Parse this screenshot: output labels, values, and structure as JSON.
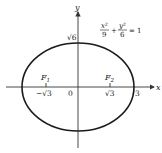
{
  "diagram": {
    "equation": {
      "x_num": "x²",
      "x_den": "9",
      "plus": "+",
      "y_num": "y²",
      "y_den": "6",
      "rhs": "= 1"
    },
    "axes": {
      "x_label": "x",
      "y_label": "y"
    },
    "labels": {
      "top_intercept": "√6",
      "origin": "0",
      "neg_focus_x": "−√3",
      "pos_focus_x": "√3",
      "right_intercept": "3",
      "focus1": "F",
      "focus1_sub": "1",
      "focus2": "F",
      "focus2_sub": "2"
    },
    "colors": {
      "stroke": "#1a1a1a",
      "axis": "#333333"
    }
  }
}
